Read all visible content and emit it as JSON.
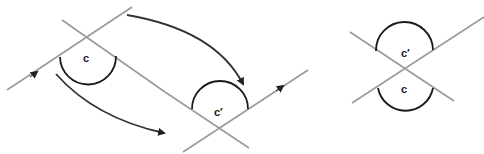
{
  "diagram": {
    "left_figure": {
      "angle_label": "c"
    },
    "middle_figure": {
      "angle_label": "c′"
    },
    "right_figure": {
      "top_angle_label": "c′",
      "bottom_angle_label": "c"
    },
    "colors": {
      "lines": "#9a9a9a",
      "arcs": "#1a1a1a",
      "arrows": "#333333",
      "background": "#ffffff"
    }
  }
}
